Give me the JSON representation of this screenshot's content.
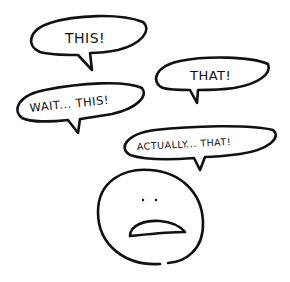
{
  "bubbles": [
    {
      "id": "this",
      "text": "THIS!"
    },
    {
      "id": "that",
      "text": "THAT!"
    },
    {
      "id": "wait_this",
      "text": "WAIT... THIS!"
    },
    {
      "id": "actually_that",
      "text": "ACTUALLY... THAT!"
    }
  ],
  "colors": {
    "ink": "#111111",
    "background": "#ffffff"
  }
}
